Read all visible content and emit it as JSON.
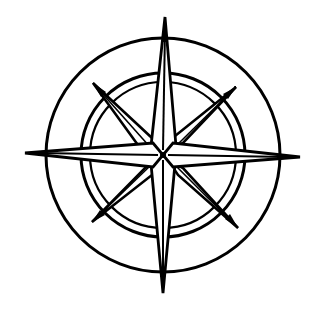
{
  "image": {
    "subject": "compass rose",
    "width": 312,
    "height": 313,
    "background": "#ffffff",
    "ink_color": "#000000",
    "fill_color": "#ffffff"
  },
  "compass": {
    "center": [
      163,
      155
    ],
    "outer_circle_radius": 117,
    "inner_ring_outer_radius": 82,
    "inner_ring_inner_radius": 73,
    "cardinal_points": {
      "north": [
        165,
        17
      ],
      "south": [
        163,
        293
      ],
      "west": [
        25,
        153
      ],
      "east": [
        300,
        157
      ]
    },
    "intercardinal_points": {
      "northwest": [
        93,
        83
      ],
      "northeast": [
        236,
        87
      ],
      "southwest": [
        92,
        222
      ],
      "southeast": [
        238,
        228
      ]
    }
  }
}
